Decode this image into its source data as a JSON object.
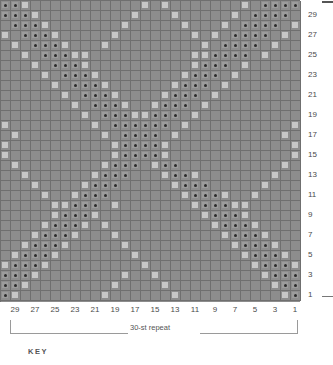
{
  "chart_data": {
    "type": "heatmap",
    "title": "",
    "xlabel": "",
    "ylabel": "",
    "columns": 30,
    "rows": 30,
    "symbols": {
      "0": "blank",
      "1": "light-square",
      "2": "dark-dot"
    },
    "row_labels": [
      "29",
      "27",
      "25",
      "23",
      "21",
      "19",
      "17",
      "15",
      "13",
      "11",
      "9",
      "7",
      "5",
      "3",
      "1"
    ],
    "col_labels": [
      "29",
      "27",
      "25",
      "23",
      "21",
      "19",
      "17",
      "15",
      "13",
      "11",
      "9",
      "7",
      "5",
      "3",
      "1"
    ],
    "grid": [
      [
        2,
        2,
        1,
        0,
        0,
        0,
        0,
        0,
        0,
        0,
        0,
        0,
        0,
        0,
        1,
        0,
        1,
        0,
        0,
        0,
        0,
        0,
        0,
        0,
        1,
        0,
        2,
        2,
        2,
        2
      ],
      [
        2,
        2,
        2,
        1,
        0,
        0,
        0,
        0,
        0,
        0,
        0,
        0,
        0,
        1,
        0,
        0,
        0,
        1,
        0,
        0,
        0,
        0,
        0,
        1,
        0,
        2,
        2,
        2,
        2,
        0
      ],
      [
        0,
        2,
        2,
        2,
        1,
        0,
        0,
        0,
        0,
        0,
        0,
        0,
        1,
        0,
        0,
        0,
        0,
        0,
        1,
        0,
        0,
        0,
        1,
        0,
        2,
        2,
        2,
        2,
        0,
        1
      ],
      [
        1,
        0,
        2,
        2,
        2,
        1,
        0,
        0,
        0,
        0,
        0,
        1,
        0,
        0,
        0,
        0,
        0,
        0,
        0,
        1,
        0,
        1,
        0,
        2,
        2,
        2,
        2,
        0,
        1,
        0
      ],
      [
        0,
        1,
        0,
        2,
        2,
        2,
        1,
        0,
        0,
        0,
        1,
        0,
        0,
        0,
        0,
        0,
        0,
        0,
        0,
        0,
        1,
        0,
        2,
        2,
        2,
        2,
        0,
        1,
        0,
        0
      ],
      [
        0,
        0,
        1,
        0,
        2,
        2,
        2,
        1,
        1,
        0,
        0,
        0,
        0,
        0,
        0,
        0,
        0,
        0,
        0,
        1,
        1,
        2,
        2,
        2,
        2,
        0,
        1,
        0,
        0,
        0
      ],
      [
        0,
        0,
        0,
        1,
        0,
        2,
        2,
        2,
        1,
        0,
        0,
        0,
        0,
        0,
        0,
        0,
        0,
        0,
        0,
        1,
        2,
        2,
        2,
        0,
        1,
        0,
        0,
        0,
        0,
        0
      ],
      [
        0,
        0,
        0,
        0,
        1,
        0,
        2,
        2,
        2,
        1,
        0,
        0,
        0,
        0,
        0,
        0,
        0,
        0,
        1,
        2,
        2,
        2,
        0,
        1,
        0,
        0,
        0,
        0,
        0,
        0
      ],
      [
        0,
        0,
        0,
        0,
        0,
        1,
        0,
        2,
        2,
        2,
        1,
        0,
        0,
        0,
        0,
        0,
        0,
        1,
        2,
        2,
        2,
        0,
        1,
        0,
        0,
        0,
        0,
        0,
        0,
        0
      ],
      [
        0,
        0,
        0,
        0,
        0,
        0,
        1,
        0,
        2,
        2,
        2,
        1,
        0,
        0,
        0,
        0,
        1,
        2,
        2,
        2,
        0,
        1,
        0,
        0,
        0,
        0,
        0,
        0,
        0,
        0
      ],
      [
        0,
        0,
        0,
        0,
        0,
        0,
        0,
        1,
        0,
        2,
        2,
        2,
        1,
        0,
        0,
        1,
        2,
        2,
        2,
        0,
        1,
        0,
        0,
        0,
        0,
        0,
        0,
        0,
        0,
        0
      ],
      [
        0,
        0,
        0,
        0,
        0,
        0,
        0,
        0,
        1,
        0,
        2,
        2,
        2,
        1,
        1,
        2,
        2,
        2,
        0,
        1,
        0,
        0,
        0,
        0,
        0,
        0,
        0,
        0,
        0,
        0
      ],
      [
        1,
        0,
        0,
        0,
        0,
        0,
        0,
        0,
        0,
        1,
        0,
        2,
        2,
        2,
        2,
        2,
        2,
        0,
        1,
        0,
        0,
        0,
        0,
        0,
        0,
        0,
        0,
        0,
        0,
        1
      ],
      [
        0,
        1,
        0,
        0,
        0,
        0,
        0,
        0,
        0,
        0,
        1,
        0,
        2,
        2,
        2,
        2,
        0,
        1,
        0,
        0,
        0,
        0,
        0,
        0,
        0,
        0,
        0,
        0,
        1,
        0
      ],
      [
        1,
        0,
        0,
        0,
        0,
        0,
        0,
        0,
        0,
        0,
        0,
        1,
        2,
        2,
        2,
        2,
        1,
        0,
        0,
        0,
        0,
        0,
        0,
        0,
        0,
        0,
        0,
        0,
        0,
        1
      ],
      [
        1,
        0,
        0,
        0,
        0,
        0,
        0,
        0,
        0,
        0,
        0,
        1,
        2,
        2,
        2,
        2,
        1,
        0,
        0,
        0,
        0,
        0,
        0,
        0,
        0,
        0,
        0,
        0,
        0,
        1
      ],
      [
        0,
        1,
        0,
        0,
        0,
        0,
        0,
        0,
        0,
        0,
        1,
        2,
        2,
        2,
        0,
        1,
        2,
        2,
        0,
        0,
        0,
        0,
        0,
        0,
        0,
        0,
        0,
        0,
        1,
        0
      ],
      [
        0,
        0,
        1,
        0,
        0,
        0,
        0,
        0,
        0,
        1,
        2,
        2,
        2,
        0,
        0,
        0,
        1,
        2,
        2,
        1,
        0,
        0,
        0,
        0,
        0,
        0,
        0,
        1,
        0,
        0
      ],
      [
        0,
        0,
        0,
        1,
        0,
        0,
        0,
        0,
        1,
        2,
        2,
        2,
        0,
        0,
        0,
        0,
        0,
        1,
        2,
        2,
        2,
        0,
        0,
        0,
        0,
        0,
        1,
        0,
        0,
        0
      ],
      [
        0,
        0,
        0,
        0,
        1,
        0,
        0,
        1,
        2,
        2,
        2,
        0,
        0,
        0,
        0,
        0,
        0,
        0,
        1,
        2,
        2,
        2,
        1,
        0,
        0,
        1,
        0,
        0,
        0,
        0
      ],
      [
        0,
        0,
        0,
        0,
        0,
        1,
        1,
        2,
        2,
        2,
        0,
        1,
        0,
        0,
        0,
        0,
        0,
        0,
        0,
        1,
        2,
        2,
        2,
        1,
        1,
        0,
        0,
        0,
        0,
        0
      ],
      [
        0,
        0,
        0,
        0,
        0,
        1,
        2,
        2,
        2,
        1,
        0,
        0,
        0,
        0,
        0,
        0,
        0,
        0,
        0,
        0,
        1,
        2,
        2,
        2,
        1,
        0,
        0,
        0,
        0,
        0
      ],
      [
        0,
        0,
        0,
        0,
        1,
        2,
        2,
        2,
        1,
        0,
        1,
        0,
        0,
        0,
        0,
        0,
        0,
        0,
        0,
        0,
        0,
        1,
        2,
        2,
        2,
        1,
        0,
        0,
        0,
        0
      ],
      [
        0,
        0,
        0,
        1,
        2,
        2,
        2,
        1,
        0,
        0,
        0,
        1,
        0,
        0,
        0,
        0,
        0,
        0,
        0,
        0,
        0,
        0,
        1,
        2,
        2,
        2,
        1,
        0,
        0,
        0
      ],
      [
        0,
        0,
        1,
        2,
        2,
        2,
        1,
        0,
        0,
        0,
        0,
        0,
        1,
        0,
        0,
        0,
        0,
        0,
        0,
        0,
        0,
        0,
        0,
        1,
        2,
        2,
        2,
        1,
        0,
        0
      ],
      [
        0,
        1,
        2,
        2,
        2,
        1,
        0,
        0,
        0,
        0,
        0,
        0,
        0,
        1,
        0,
        0,
        0,
        0,
        0,
        0,
        0,
        0,
        0,
        0,
        1,
        2,
        2,
        2,
        1,
        0
      ],
      [
        1,
        2,
        2,
        2,
        1,
        0,
        0,
        0,
        0,
        0,
        0,
        0,
        0,
        0,
        1,
        0,
        0,
        0,
        0,
        0,
        0,
        0,
        0,
        0,
        0,
        1,
        2,
        2,
        2,
        1
      ],
      [
        2,
        2,
        2,
        1,
        0,
        0,
        0,
        0,
        0,
        0,
        0,
        0,
        1,
        0,
        0,
        1,
        0,
        0,
        0,
        0,
        0,
        0,
        0,
        0,
        0,
        0,
        1,
        2,
        2,
        2
      ],
      [
        2,
        2,
        1,
        0,
        0,
        0,
        0,
        0,
        0,
        0,
        0,
        1,
        0,
        0,
        0,
        0,
        1,
        0,
        0,
        0,
        0,
        0,
        0,
        0,
        0,
        0,
        0,
        1,
        2,
        2
      ],
      [
        2,
        1,
        0,
        0,
        0,
        0,
        0,
        0,
        0,
        0,
        1,
        0,
        0,
        0,
        0,
        0,
        0,
        1,
        0,
        0,
        0,
        0,
        0,
        0,
        0,
        0,
        0,
        0,
        1,
        2
      ]
    ]
  },
  "annotations": {
    "repeat_label": "30-st repeat",
    "key_label": "KEY"
  },
  "colors": {
    "grid_background": "#8d8d8d",
    "grid_line": "#6f6f6f",
    "light_symbol": "#c6c6c6",
    "dot_symbol": "#2b2b2b",
    "label_text": "#4a4a4a",
    "bracket": "#9a9a9a"
  }
}
